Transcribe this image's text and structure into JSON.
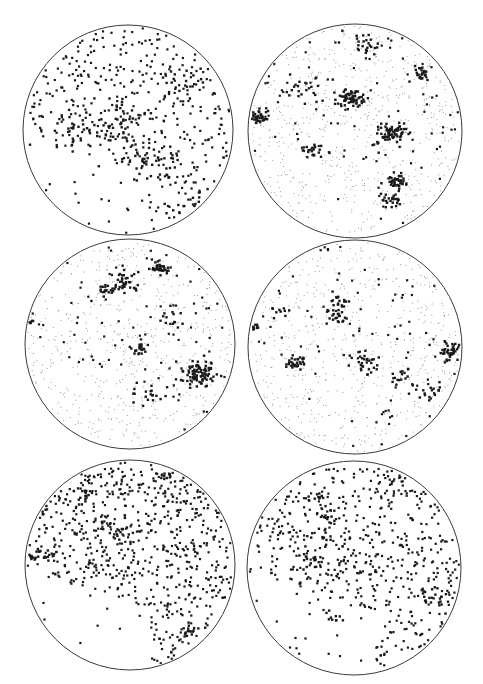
{
  "figure": {
    "background": "#ffffff",
    "outline_color": "#3a3a3a",
    "point_color": "#1a1a1a",
    "faint_point_color": "#9a9a9a"
  },
  "chart_data": {
    "type": "scatter",
    "title": "",
    "xlabel": "",
    "ylabel": "",
    "grid": false,
    "legend": null,
    "panels": [
      {
        "id": "a",
        "row": 1,
        "col": 1,
        "cx": 128,
        "cy": 130,
        "r": 105,
        "uniform_dark": 520,
        "faint": 0,
        "clusters": [
          [
            120,
            115,
            14,
            40
          ],
          [
            180,
            82,
            12,
            20
          ],
          [
            150,
            160,
            18,
            50
          ],
          [
            75,
            130,
            15,
            30
          ],
          [
            200,
            210,
            14,
            25
          ]
        ]
      },
      {
        "id": "b",
        "row": 1,
        "col": 2,
        "cx": 355,
        "cy": 131,
        "r": 107,
        "uniform_dark": 120,
        "faint": 700,
        "clusters": [
          [
            352,
            98,
            7,
            60
          ],
          [
            391,
            133,
            8,
            70
          ],
          [
            256,
            117,
            6,
            40
          ],
          [
            420,
            73,
            5,
            25
          ],
          [
            398,
            180,
            5,
            35
          ],
          [
            393,
            200,
            6,
            25
          ],
          [
            305,
            88,
            12,
            25
          ],
          [
            310,
            150,
            6,
            20
          ],
          [
            365,
            45,
            10,
            25
          ]
        ]
      },
      {
        "id": "c",
        "row": 2,
        "col": 1,
        "cx": 130,
        "cy": 344,
        "r": 105,
        "uniform_dark": 110,
        "faint": 650,
        "clusters": [
          [
            160,
            268,
            5,
            35
          ],
          [
            125,
            282,
            7,
            40
          ],
          [
            200,
            374,
            10,
            90
          ],
          [
            140,
            350,
            4,
            20
          ],
          [
            104,
            292,
            6,
            15
          ],
          [
            30,
            322,
            3,
            10
          ],
          [
            170,
            320,
            6,
            15
          ],
          [
            150,
            395,
            10,
            20
          ]
        ]
      },
      {
        "id": "d",
        "row": 2,
        "col": 2,
        "cx": 355,
        "cy": 347,
        "r": 107,
        "uniform_dark": 110,
        "faint": 650,
        "clusters": [
          [
            296,
            363,
            6,
            30
          ],
          [
            365,
            363,
            8,
            30
          ],
          [
            450,
            352,
            6,
            45
          ],
          [
            340,
            302,
            6,
            20
          ],
          [
            336,
            317,
            5,
            20
          ],
          [
            276,
            312,
            4,
            10
          ],
          [
            255,
            327,
            3,
            10
          ],
          [
            400,
            375,
            6,
            15
          ],
          [
            425,
            390,
            8,
            20
          ]
        ]
      },
      {
        "id": "e",
        "row": 3,
        "col": 1,
        "cx": 130,
        "cy": 565,
        "r": 105,
        "uniform_dark": 900,
        "faint": 0,
        "clusters": [
          [
            83,
            495,
            6,
            15
          ],
          [
            40,
            510,
            5,
            15
          ],
          [
            40,
            555,
            6,
            20
          ],
          [
            120,
            532,
            8,
            15
          ],
          [
            170,
            475,
            5,
            12
          ],
          [
            195,
            630,
            8,
            15
          ]
        ]
      },
      {
        "id": "f",
        "row": 3,
        "col": 2,
        "cx": 354,
        "cy": 568,
        "r": 107,
        "uniform_dark": 700,
        "faint": 0,
        "clusters": [
          [
            322,
            537,
            8,
            15
          ],
          [
            308,
            560,
            7,
            15
          ],
          [
            330,
            515,
            5,
            10
          ],
          [
            430,
            600,
            8,
            20
          ],
          [
            335,
            618,
            5,
            10
          ],
          [
            317,
            497,
            5,
            10
          ]
        ]
      }
    ],
    "cluster_format": "[x, y, spread_px, point_count]"
  }
}
